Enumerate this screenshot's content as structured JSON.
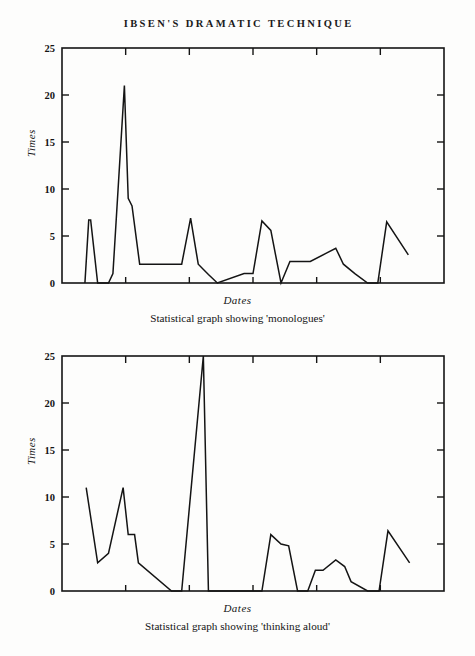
{
  "page": {
    "running_head": "IBSEN'S DRAMATIC TECHNIQUE",
    "background_color": "#fdfdfc",
    "ink_color": "#141414"
  },
  "figures": [
    {
      "id": "figure-1",
      "caption": "Statistical graph showing 'monologues'",
      "xlabel": "Dates",
      "ylabel": "Times"
    },
    {
      "id": "figure-2",
      "caption": "Statistical graph showing 'thinking aloud'",
      "xlabel": "Dates",
      "ylabel": "Times"
    }
  ],
  "chart_data": [
    {
      "type": "line",
      "title": "Statistical graph showing 'monologues'",
      "xlabel": "Dates",
      "ylabel": "Times",
      "xlim": [
        1845,
        1905
      ],
      "ylim": [
        0,
        25
      ],
      "xticks": [
        1845,
        1855,
        1865,
        1875,
        1885,
        1895,
        1905
      ],
      "yticks": [
        0,
        5,
        10,
        15,
        20,
        25
      ],
      "grid": false,
      "legend": null,
      "frame": "box",
      "x": [
        1848.6,
        1849.2,
        1849.5,
        1850.6,
        1851.2,
        1852.3,
        1853.0,
        1854.8,
        1855.4,
        1856.0,
        1857.2,
        1862.8,
        1863.8,
        1865.2,
        1866.4,
        1868.0,
        1869.4,
        1873.6,
        1875.0,
        1876.4,
        1877.8,
        1879.4,
        1880.8,
        1882.0,
        1884.0,
        1886.6,
        1888.0,
        1889.2,
        1891.0,
        1893.0,
        1894.2,
        1894.6,
        1896.0,
        1899.4
      ],
      "y": [
        0,
        6.7,
        6.7,
        0,
        0,
        0,
        1.0,
        21.0,
        9.0,
        8.2,
        2.0,
        2.0,
        2.0,
        6.9,
        2.0,
        0.9,
        0,
        1.0,
        1.0,
        6.6,
        5.6,
        0,
        2.3,
        2.3,
        2.3,
        3.2,
        3.7,
        2.0,
        1.0,
        0,
        0,
        0,
        6.5,
        3.0
      ]
    },
    {
      "type": "line",
      "title": "Statistical graph showing 'thinking aloud'",
      "xlabel": "Dates",
      "ylabel": "Times",
      "xlim": [
        1845,
        1905
      ],
      "ylim": [
        0,
        25
      ],
      "xticks": [
        1845,
        1855,
        1865,
        1875,
        1885,
        1895,
        1905
      ],
      "yticks": [
        0,
        5,
        10,
        15,
        20,
        25
      ],
      "grid": false,
      "legend": null,
      "frame": "box",
      "x": [
        1848.8,
        1850.6,
        1852.3,
        1854.6,
        1855.4,
        1856.4,
        1857.0,
        1862.2,
        1863.8,
        1867.2,
        1868.0,
        1876.4,
        1877.8,
        1879.4,
        1880.6,
        1882.0,
        1883.6,
        1884.8,
        1886.0,
        1888.0,
        1889.4,
        1890.4,
        1893.0,
        1894.4,
        1894.8,
        1896.2,
        1899.6
      ],
      "y": [
        11.0,
        3.0,
        4.0,
        11.0,
        6.0,
        6.0,
        3.0,
        0,
        0,
        25.0,
        0,
        0,
        6.0,
        5.0,
        4.8,
        0,
        0,
        2.2,
        2.2,
        3.3,
        2.6,
        1.0,
        0,
        0,
        0,
        6.4,
        3.0
      ]
    }
  ]
}
